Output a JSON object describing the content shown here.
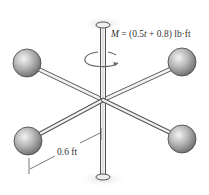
{
  "diagram": {
    "type": "rotating-assembly",
    "moment_label": "M = (0.5t + 0.8) lb·ft",
    "moment_label_parts": {
      "symbol": "M",
      "equals": " = (0.5",
      "var": "t",
      "rest": " + 0.8) lb·ft"
    },
    "dimension_label": "0.6 ft",
    "components": [
      {
        "name": "vertical-shaft"
      },
      {
        "name": "top-bearing-cap"
      },
      {
        "name": "bottom-bearing-cap"
      },
      {
        "name": "rotation-arrow"
      },
      {
        "name": "sphere",
        "position": "upper-left"
      },
      {
        "name": "sphere",
        "position": "upper-right"
      },
      {
        "name": "sphere",
        "position": "lower-left"
      },
      {
        "name": "sphere",
        "position": "lower-right"
      }
    ],
    "colors": {
      "sphere_light": "#e6e6e6",
      "sphere_dark": "#6e6e6e",
      "rod_fill": "#f2f2f2",
      "rod_stroke": "#555555",
      "shadow": "#e4e4e4",
      "text": "#333333"
    }
  }
}
